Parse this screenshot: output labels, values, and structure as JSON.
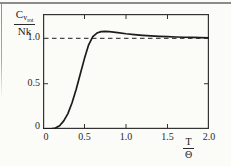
{
  "figure": {
    "paper_color": "#fbfbf8",
    "frame_color": "#333333",
    "curve_color": "#1c1c1c",
    "dash_color": "#4a4a4a",
    "rule_color": "#8b8b8b",
    "text_color": "#2a2a2a"
  },
  "ylabel": {
    "numerator_main": "C",
    "numerator_sub": "v",
    "numerator_subsub": "rot",
    "denominator": "Nk"
  },
  "xlabel": {
    "numerator": "T",
    "denominator": "Θ"
  },
  "chart_data": {
    "type": "line",
    "title": "",
    "xlabel": "T/Θ",
    "ylabel": "C_v_rot/Nk",
    "xlim": [
      0,
      2.0
    ],
    "ylim": [
      0,
      1.27
    ],
    "grid": false,
    "legend": "none",
    "asymptote_y": 1.0,
    "asymptote_style": "dashed",
    "x_ticks": [
      {
        "value": 0,
        "label": "0"
      },
      {
        "value": 0.5,
        "label": "0.5"
      },
      {
        "value": 1.0,
        "label": "1.0"
      },
      {
        "value": 1.5,
        "label": "1.5"
      },
      {
        "value": 2.0,
        "label": "2.0"
      }
    ],
    "x_tick_marks": [
      0.5,
      1.0,
      1.5
    ],
    "y_ticks": [
      {
        "value": 0,
        "label": "0"
      },
      {
        "value": 0.5,
        "label": "0.5"
      },
      {
        "value": 1.0,
        "label": "1.0"
      }
    ],
    "y_tick_marks": [
      0.5
    ],
    "series": [
      {
        "name": "rotational-heat-capacity",
        "x": [
          0,
          0.05,
          0.1,
          0.15,
          0.2,
          0.25,
          0.3,
          0.35,
          0.4,
          0.45,
          0.5,
          0.55,
          0.6,
          0.65,
          0.7,
          0.75,
          0.8,
          0.9,
          1.0,
          1.1,
          1.2,
          1.3,
          1.4,
          1.5,
          1.6,
          1.7,
          1.8,
          1.9,
          2.0
        ],
        "y": [
          0,
          0.001,
          0.003,
          0.01,
          0.035,
          0.09,
          0.17,
          0.29,
          0.44,
          0.61,
          0.78,
          0.93,
          1.02,
          1.06,
          1.075,
          1.078,
          1.075,
          1.065,
          1.052,
          1.043,
          1.035,
          1.029,
          1.024,
          1.02,
          1.016,
          1.013,
          1.011,
          1.009,
          1.007
        ]
      }
    ]
  }
}
